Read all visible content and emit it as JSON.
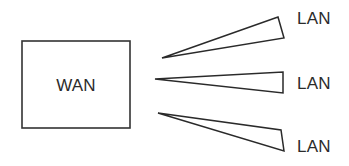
{
  "diagram": {
    "background_color": "#ffffff",
    "stroke_color": "#333333",
    "text_color": "#2b2b2b",
    "nodes": [
      {
        "id": "wan",
        "label": "WAN",
        "shape": "rectangle",
        "x": 22,
        "y": 41,
        "width": 108,
        "height": 87,
        "label_x": 76,
        "label_y": 91
      }
    ],
    "connections": [
      {
        "id": "lan-1",
        "label": "LAN",
        "shape": "cone",
        "points": "162,58 278,17 284,38",
        "label_x": 297,
        "label_y": 24
      },
      {
        "id": "lan-2",
        "label": "LAN",
        "shape": "cone",
        "points": "155,79 283,72 283,93",
        "label_x": 297,
        "label_y": 89
      },
      {
        "id": "lan-3",
        "label": "LAN",
        "shape": "cone",
        "points": "158,113 281,130 284,151",
        "label_x": 297,
        "label_y": 152
      }
    ]
  }
}
